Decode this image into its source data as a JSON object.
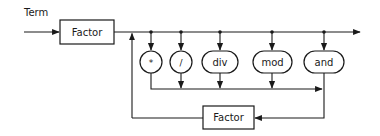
{
  "diagram": {
    "title": "Term",
    "nodes": {
      "factor_top": {
        "label": "Factor",
        "shape": "rectangle"
      },
      "factor_bottom": {
        "label": "Factor",
        "shape": "rectangle"
      },
      "op_mul": {
        "label": "*",
        "shape": "circle"
      },
      "op_div_slash": {
        "label": "/",
        "shape": "circle"
      },
      "op_div": {
        "label": "div",
        "shape": "rounded"
      },
      "op_mod": {
        "label": "mod",
        "shape": "rounded"
      },
      "op_and": {
        "label": "and",
        "shape": "rounded"
      }
    },
    "edges": [
      "entry -> Factor",
      "Factor -> exit",
      "branch -> *",
      "branch -> /",
      "branch -> div",
      "branch -> mod",
      "branch -> and",
      "operators -> Factor (bottom)",
      "Factor (bottom) -> loop back before operators"
    ],
    "colors": {
      "stroke": "#1a1a1a",
      "background": "#ffffff"
    }
  }
}
